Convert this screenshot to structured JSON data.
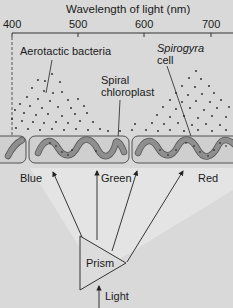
{
  "axis": {
    "title": "Wavelength of light (nm)",
    "ticks": [
      "400",
      "500",
      "600",
      "700"
    ]
  },
  "labels": {
    "bacteria": "Aerotactic bacteria",
    "spirogyra_italic": "Spirogyra",
    "spirogyra_rest": "cell",
    "chloroplast_line1": "Spiral",
    "chloroplast_line2": "chloroplast",
    "blue": "Blue",
    "green": "Green",
    "red": "Red",
    "prism": "Prism",
    "light": "Light"
  },
  "colors": {
    "background": "#d9d9d9",
    "light_cone": "#e4e4e4",
    "cell_fill": "#cfcfcf",
    "chloroplast": "#8f8f8f",
    "ink": "#1a1a1a"
  }
}
